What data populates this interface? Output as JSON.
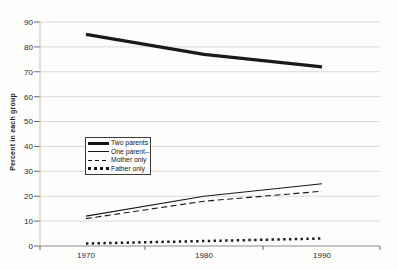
{
  "chart_data": {
    "type": "line",
    "ylabel": "Percent in each group",
    "x_ticks": [
      "1970",
      "1980",
      "1990"
    ],
    "y_tick_labels": [
      "90",
      "80",
      "70",
      "60",
      "50",
      "40",
      "30",
      "20",
      "10",
      "0"
    ],
    "ylim": [
      0,
      90
    ],
    "grid": "horizontal-only",
    "legend_position": "inside-left-middle",
    "series": [
      {
        "name": "Two parents",
        "style": "solid-thick",
        "values": [
          85,
          77,
          72
        ]
      },
      {
        "name": "One parent--",
        "style": "solid-thin",
        "values": [
          12,
          20,
          25
        ]
      },
      {
        "name": "Mother only",
        "style": "dashed",
        "values": [
          11,
          18,
          22
        ]
      },
      {
        "name": "Father only",
        "style": "dotted-thick",
        "values": [
          1,
          2,
          3
        ]
      }
    ],
    "line_color": "#1a1a1a",
    "grid_color": "#d6d6d4",
    "axis_color": "#8c8c8c",
    "tick_color": "#5a5a5a"
  }
}
